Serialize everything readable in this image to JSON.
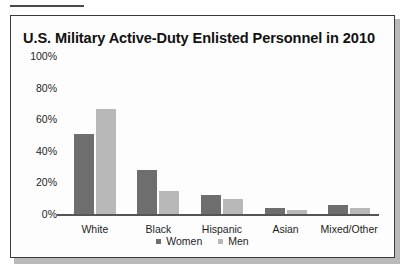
{
  "figure": {
    "title": "U.S. Military Active-Duty Enlisted Personnel in 2010"
  },
  "colors": {
    "women": "#6e6e6e",
    "men": "#b8b8b8",
    "axis": "#555555",
    "frame": "#3b3b3b",
    "text": "#1d1d1d"
  },
  "chart_data": {
    "type": "bar",
    "title": "U.S. Military Active-Duty Enlisted Personnel in 2010",
    "xlabel": "",
    "ylabel": "",
    "categories": [
      "White",
      "Black",
      "Hispanic",
      "Asian",
      "Mixed/Other"
    ],
    "series": [
      {
        "name": "Women",
        "values": [
          51,
          28,
          12,
          4,
          6
        ]
      },
      {
        "name": "Men",
        "values": [
          67,
          15,
          10,
          3,
          4
        ]
      }
    ],
    "ylim": [
      0,
      100
    ],
    "yticks": [
      100,
      80,
      60,
      40,
      20,
      0
    ],
    "ytick_labels": [
      "100%",
      "80%",
      "60%",
      "40%",
      "20%",
      "0%"
    ],
    "grid": false,
    "legend": [
      "Women",
      "Men"
    ],
    "legend_position": "bottom-center",
    "value_unit": "%"
  }
}
